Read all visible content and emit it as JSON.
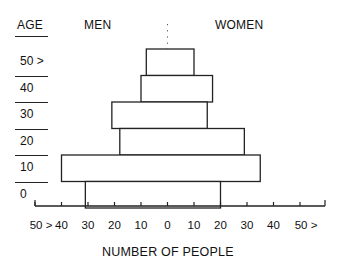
{
  "chart_data": {
    "type": "bar",
    "subtype": "population-pyramid",
    "title": "",
    "xlabel": "NUMBER OF PEOPLE",
    "ylabel": "AGE",
    "left_header": "MEN",
    "right_header": "WOMEN",
    "categories": [
      "50 >",
      "40",
      "30",
      "20",
      "10",
      "0"
    ],
    "series": [
      {
        "name": "MEN",
        "side": "left",
        "values": [
          8,
          10,
          21,
          18,
          40,
          31
        ]
      },
      {
        "name": "WOMEN",
        "side": "right",
        "values": [
          10,
          17,
          15,
          29,
          35,
          20
        ]
      }
    ],
    "x_tick_labels": [
      "50 >",
      "40",
      "30",
      "20",
      "10",
      "0",
      "10",
      "20",
      "30",
      "40",
      "50 >"
    ],
    "x_tick_values": [
      -50,
      -40,
      -30,
      -20,
      -10,
      0,
      10,
      20,
      30,
      40,
      50
    ],
    "xlim": [
      -50,
      50
    ],
    "grid": false,
    "center_line": "dotted",
    "legend": "none",
    "colors": {
      "bar_fill": "#ffffff",
      "bar_stroke": "#222222",
      "text": "#111111"
    }
  },
  "labels": {
    "age_header": "AGE",
    "men_header": "MEN",
    "women_header": "WOMEN",
    "x_axis_title": "NUMBER OF PEOPLE"
  }
}
